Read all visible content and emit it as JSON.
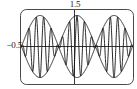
{
  "figure": {
    "name": "beat-waveform-plot",
    "frame": {
      "x": 20,
      "y": 9,
      "width": 114,
      "height": 76,
      "corner_radius": 6,
      "stroke": "#4a4a4a",
      "stroke_width": 1
    },
    "axes": {
      "x_axis_y": 46.5,
      "y_axis_x": 74.5,
      "stroke": "#3a3a3a",
      "stroke_width": 1
    }
  },
  "labels": {
    "top": "1.5",
    "left": "−0.5"
  },
  "colors": {
    "curve": "#0d0d0d",
    "frame": "#4a4a4a",
    "axis": "#3a3a3a",
    "background": "#ffffff",
    "text": "#1a1a1a"
  },
  "chart_data": {
    "type": "line",
    "title": "",
    "subtitle": "",
    "xlabel": "",
    "ylabel": "",
    "grid": false,
    "legend": null,
    "xlim": [
      0,
      18.85
    ],
    "ylim": [
      -1.5,
      1.5
    ],
    "x_tick_labels": [],
    "y_tick_labels": [
      "−0.5"
    ],
    "annotations": [
      {
        "text": "1.5",
        "position": "top-center",
        "x": 9.42,
        "y": 1.5
      },
      {
        "text": "−0.5",
        "position": "left-axis",
        "x": 0,
        "y": -0.5
      }
    ],
    "series": [
      {
        "name": "beat",
        "formula": "y = sin(0.3183*x*pi) * cos(3.1831*x*pi)",
        "carrier_cycles_per_lobe": 5,
        "envelope_lobes": 3,
        "amplitude": 1.0
      },
      {
        "name": "upper-envelope",
        "formula": "y = |sin(0.3183*x*pi)|",
        "amplitude": 1.0
      },
      {
        "name": "lower-envelope",
        "formula": "y = -|sin(0.3183*x*pi)|",
        "amplitude": 1.0
      }
    ]
  }
}
